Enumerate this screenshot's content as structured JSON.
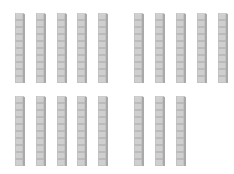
{
  "diagram": {
    "description": "Base-ten blocks: tens rods",
    "rod_units": 10,
    "rod_count": 18,
    "total_value": 180,
    "colors": {
      "face": "#cfcfcf",
      "side": "#a9a9a9",
      "top": "#e2e2e2",
      "divider": "#8f8f8f",
      "background": "#ffffff"
    },
    "groups": [
      {
        "name": "top-left",
        "count": 5,
        "y": 13,
        "x": [
          15,
          36,
          57,
          77,
          98
        ]
      },
      {
        "name": "top-right",
        "count": 5,
        "y": 13,
        "x": [
          134,
          155,
          176,
          197,
          218
        ]
      },
      {
        "name": "bottom-left",
        "count": 5,
        "y": 96,
        "x": [
          15,
          36,
          57,
          77,
          98
        ]
      },
      {
        "name": "bottom-right",
        "count": 3,
        "y": 96,
        "x": [
          134,
          155,
          176
        ]
      }
    ]
  }
}
